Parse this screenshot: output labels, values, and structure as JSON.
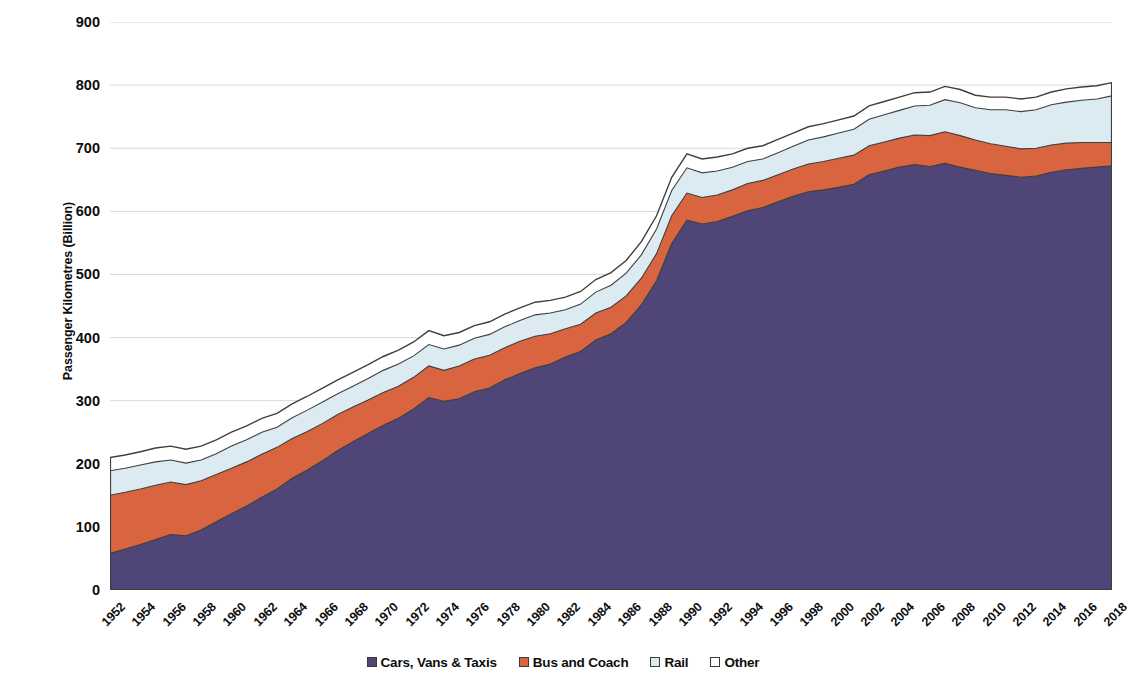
{
  "chart_data": {
    "type": "area",
    "stacked": true,
    "title": "",
    "xlabel": "",
    "ylabel": "Passenger Kilometres (Billion)",
    "ylim": [
      0,
      900
    ],
    "ytick_values": [
      0,
      100,
      200,
      300,
      400,
      500,
      600,
      700,
      800,
      900
    ],
    "ytick_labels": [
      "0",
      "100",
      "200",
      "300",
      "400",
      "500",
      "600",
      "700",
      "800",
      "900"
    ],
    "grid": "horizontal",
    "legend_position": "bottom",
    "xlim": [
      1952,
      2018
    ],
    "xtick_labels": [
      "1952",
      "1954",
      "1956",
      "1958",
      "1960",
      "1962",
      "1964",
      "1966",
      "1968",
      "1970",
      "1972",
      "1974",
      "1976",
      "1978",
      "1980",
      "1982",
      "1984",
      "1986",
      "1988",
      "1990",
      "1992",
      "1994",
      "1996",
      "1998",
      "2000",
      "2002",
      "2004",
      "2006",
      "2008",
      "2010",
      "2012",
      "2014",
      "2016",
      "2018"
    ],
    "x": [
      1952,
      1953,
      1954,
      1955,
      1956,
      1957,
      1958,
      1959,
      1960,
      1961,
      1962,
      1963,
      1964,
      1965,
      1966,
      1967,
      1968,
      1969,
      1970,
      1971,
      1972,
      1973,
      1974,
      1975,
      1976,
      1977,
      1978,
      1979,
      1980,
      1981,
      1982,
      1983,
      1984,
      1985,
      1986,
      1987,
      1988,
      1989,
      1990,
      1991,
      1992,
      1993,
      1994,
      1995,
      1996,
      1997,
      1998,
      1999,
      2000,
      2001,
      2002,
      2003,
      2004,
      2005,
      2006,
      2007,
      2008,
      2009,
      2010,
      2011,
      2012,
      2013,
      2014,
      2015,
      2016,
      2017,
      2018
    ],
    "series": [
      {
        "name": "Cars, Vans & Taxis",
        "color": "#4F4677",
        "values": [
          58,
          65,
          72,
          80,
          88,
          86,
          95,
          108,
          121,
          133,
          147,
          160,
          177,
          190,
          205,
          221,
          235,
          248,
          261,
          272,
          287,
          305,
          299,
          303,
          314,
          320,
          333,
          343,
          352,
          358,
          369,
          378,
          396,
          406,
          424,
          452,
          490,
          549,
          586,
          580,
          584,
          592,
          601,
          606,
          615,
          624,
          631,
          634,
          638,
          643,
          658,
          664,
          670,
          674,
          671,
          676,
          670,
          665,
          660,
          657,
          654,
          656,
          662,
          666,
          668,
          670,
          672
        ]
      },
      {
        "name": "Bus and Coach",
        "color": "#D8653F",
        "values": [
          92,
          90,
          88,
          86,
          83,
          81,
          78,
          75,
          72,
          70,
          68,
          66,
          63,
          61,
          59,
          57,
          55,
          53,
          52,
          51,
          50,
          50,
          49,
          52,
          52,
          52,
          51,
          51,
          50,
          48,
          45,
          43,
          43,
          42,
          42,
          42,
          43,
          44,
          43,
          42,
          42,
          42,
          43,
          43,
          43,
          43,
          44,
          45,
          46,
          46,
          46,
          46,
          46,
          47,
          49,
          50,
          50,
          48,
          47,
          46,
          45,
          44,
          43,
          42,
          41,
          39,
          37
        ]
      },
      {
        "name": "Rail",
        "color": "#DCEAF2",
        "values": [
          39,
          38,
          38,
          37,
          35,
          34,
          33,
          33,
          35,
          35,
          35,
          32,
          33,
          34,
          34,
          33,
          33,
          34,
          35,
          35,
          34,
          34,
          34,
          33,
          33,
          33,
          33,
          33,
          34,
          33,
          30,
          32,
          33,
          35,
          36,
          37,
          39,
          40,
          40,
          39,
          38,
          36,
          35,
          34,
          35,
          36,
          38,
          39,
          40,
          41,
          42,
          43,
          44,
          46,
          48,
          51,
          52,
          51,
          54,
          58,
          59,
          61,
          64,
          65,
          67,
          69,
          74
        ]
      },
      {
        "name": "Other",
        "color": "#FFFFFF",
        "values": [
          21,
          21,
          21,
          22,
          22,
          22,
          22,
          22,
          22,
          22,
          22,
          22,
          22,
          22,
          22,
          22,
          22,
          22,
          22,
          22,
          22,
          22,
          21,
          20,
          20,
          20,
          20,
          20,
          20,
          20,
          20,
          20,
          20,
          20,
          20,
          21,
          21,
          21,
          22,
          22,
          22,
          21,
          21,
          21,
          21,
          21,
          21,
          21,
          21,
          21,
          21,
          21,
          21,
          21,
          21,
          21,
          21,
          20,
          20,
          20,
          20,
          20,
          20,
          21,
          21,
          21,
          21
        ]
      }
    ]
  },
  "legend": {
    "items": [
      {
        "label": "Cars, Vans & Taxis",
        "color": "#4F4677"
      },
      {
        "label": "Bus and Coach",
        "color": "#D8653F"
      },
      {
        "label": "Rail",
        "color": "#DCEAF2"
      },
      {
        "label": "Other",
        "color": "#FFFFFF"
      }
    ]
  },
  "axes": {
    "y_title": "Passenger Kilometres (Billion)"
  },
  "style": {
    "grid_color": "#d9d9d9",
    "line_color": "#3f3f3f",
    "text_color": "#0d0d0d"
  }
}
